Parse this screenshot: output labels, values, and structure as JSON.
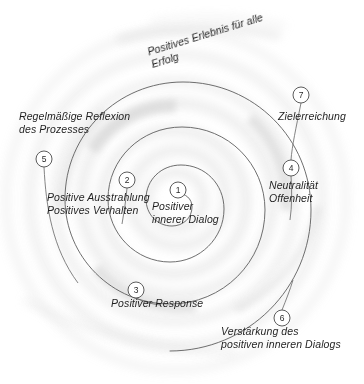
{
  "diagram": {
    "background_color": "#ffffff",
    "line_color": "#6b6b6b",
    "wash_color": "#d9d9d9",
    "text_color": "#1f1f1f",
    "center": {
      "x": 176,
      "y": 200
    },
    "nodes": [
      {
        "id": "1",
        "marker": "1",
        "cx": 178,
        "cy": 190,
        "label_lines": [
          "Positiver",
          "innerer Dialog"
        ],
        "label_x": 152,
        "label_y": 200,
        "rotate": 0
      },
      {
        "id": "2",
        "marker": "2",
        "cx": 127,
        "cy": 180,
        "label_lines": [
          "Positive Ausstrahlung",
          "Positives Verhalten"
        ],
        "label_x": 47,
        "label_y": 191,
        "rotate": 0
      },
      {
        "id": "3",
        "marker": "3",
        "cx": 136,
        "cy": 290,
        "label_lines": [
          "Positiver Response"
        ],
        "label_x": 111,
        "label_y": 297,
        "rotate": 0
      },
      {
        "id": "4",
        "marker": "4",
        "cx": 291,
        "cy": 168,
        "label_lines": [
          "Neutralität",
          "Offenheit"
        ],
        "label_x": 269,
        "label_y": 179,
        "rotate": 0
      },
      {
        "id": "5",
        "marker": "5",
        "cx": 44,
        "cy": 159,
        "label_lines": [
          "Regelmäßige Reflexion",
          "des Prozesses"
        ],
        "label_x": 19,
        "label_y": 110,
        "rotate": 0
      },
      {
        "id": "6",
        "marker": "6",
        "cx": 282,
        "cy": 318,
        "label_lines": [
          "Verstärkung des",
          "positiven inneren Dialogs"
        ],
        "label_x": 221,
        "label_y": 325,
        "rotate": 0
      },
      {
        "id": "7",
        "marker": "7",
        "cx": 301,
        "cy": 95,
        "label_lines": [
          "Zielerreichung"
        ],
        "label_x": 278,
        "label_y": 110,
        "rotate": 0
      }
    ],
    "outcome": {
      "lines": [
        "Positives Erlebnis für alle",
        "Erfolg"
      ],
      "x": 146,
      "y": 46,
      "rotate": -17
    }
  }
}
